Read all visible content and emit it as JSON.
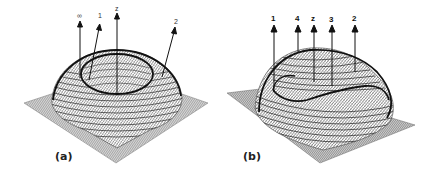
{
  "figure": {
    "panels": [
      {
        "id": "a",
        "label": "(a)",
        "description": "3D mesh surface: dome with central depression (ring-shaped ridge) on flat square base",
        "arrows": [
          {
            "label": "∞"
          },
          {
            "label": "1"
          },
          {
            "label": "z"
          },
          {
            "label": "2"
          }
        ]
      },
      {
        "id": "b",
        "label": "(b)",
        "description": "3D mesh surface: asymmetric dome with off-center ridge curve on flat square base",
        "arrows": [
          {
            "label": "1"
          },
          {
            "label": "4"
          },
          {
            "label": "z"
          },
          {
            "label": "3"
          },
          {
            "label": "2"
          }
        ]
      }
    ],
    "colors": {
      "mesh": "#3a3a3a",
      "ridge": "#111111",
      "base": "#7a7a7a",
      "background": "#ffffff"
    }
  }
}
